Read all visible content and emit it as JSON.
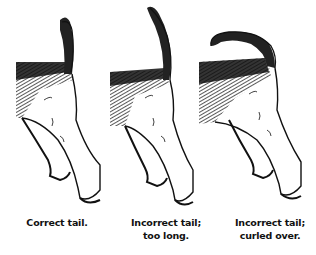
{
  "figures": [
    {
      "id": "correct",
      "caption_line1": "Correct tail.",
      "caption_line2": ""
    },
    {
      "id": "too-long",
      "caption_line1": "Incorrect tail;",
      "caption_line2": "too long."
    },
    {
      "id": "curled-over",
      "caption_line1": "Incorrect tail;",
      "caption_line2": "curled over."
    }
  ],
  "colors": {
    "ink": "#111111",
    "background": "#ffffff"
  }
}
